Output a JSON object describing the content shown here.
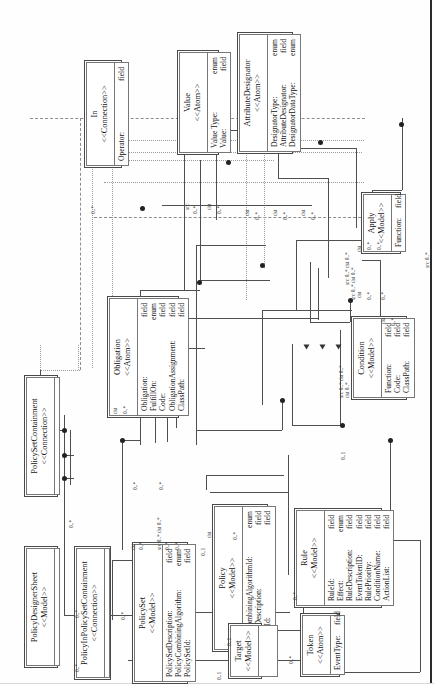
{
  "diagram": {
    "orientation": "rotated-90-ccw",
    "line_color": "#4f4f4f",
    "box_border_color": "#4a4a4a",
    "background": "#ffffff"
  },
  "classes": [
    {
      "id": "policy-designer-sheet",
      "name": "PolicyDesignerSheet",
      "stereotype": "<<Model>>",
      "attributes": []
    },
    {
      "id": "policy-set-containment",
      "name": "PolicySetContainment",
      "stereotype": "<<Connection>>",
      "attributes": []
    },
    {
      "id": "policy-in-policy-set-containment",
      "name": "PolicyInPolicySetContainment",
      "stereotype": "<<Connection>>",
      "attributes": []
    },
    {
      "id": "policy-set",
      "name": "PolicySet",
      "stereotype": "<<Model>>",
      "attributes": [
        {
          "aname": "PolicySetDescription:",
          "atype": "field"
        },
        {
          "aname": "PolicyCombiningAlgorithm:",
          "atype": "enum"
        },
        {
          "aname": "PolicySetId:",
          "atype": "field"
        }
      ]
    },
    {
      "id": "policy",
      "name": "Policy",
      "stereotype": "<<Model>>",
      "attributes": [
        {
          "aname": "RuleCombiningAlgorithmId:",
          "atype": "enum"
        },
        {
          "aname": "PolicyDescription:",
          "atype": "field"
        },
        {
          "aname": "PolicyId:",
          "atype": "field"
        }
      ]
    },
    {
      "id": "target",
      "name": "Target",
      "stereotype": "<<Model>>",
      "attributes": []
    },
    {
      "id": "token",
      "name": "Token",
      "stereotype": "<<Atom>>",
      "attributes": [
        {
          "aname": "EventType:",
          "atype": "field"
        }
      ]
    },
    {
      "id": "rule",
      "name": "Rule",
      "stereotype": "<<Model>>",
      "attributes": [
        {
          "aname": "RuleId:",
          "atype": "field"
        },
        {
          "aname": "Effect:",
          "atype": "enum"
        },
        {
          "aname": "RuleDescription:",
          "atype": "field"
        },
        {
          "aname": "EventTokenID:",
          "atype": "field"
        },
        {
          "aname": "RulePriority:",
          "atype": "field"
        },
        {
          "aname": "ConditionName:",
          "atype": "field"
        },
        {
          "aname": "ActionList:",
          "atype": "field"
        }
      ]
    },
    {
      "id": "condition",
      "name": "Condition",
      "stereotype": "<<Model>>",
      "attributes": [
        {
          "aname": "Function:",
          "atype": "field"
        },
        {
          "aname": "Code:",
          "atype": "field"
        },
        {
          "aname": "ClassPath:",
          "atype": "field"
        }
      ]
    },
    {
      "id": "obligation",
      "name": "Obligation",
      "stereotype": "<<Atom>>",
      "attributes": [
        {
          "aname": "Obligation:",
          "atype": "field"
        },
        {
          "aname": "FulfillOn:",
          "atype": "enum"
        },
        {
          "aname": "Code:",
          "atype": "field"
        },
        {
          "aname": "ObligationAssignment:",
          "atype": "field"
        },
        {
          "aname": "ClassPath:",
          "atype": "field"
        }
      ]
    },
    {
      "id": "apply",
      "name": "Apply",
      "stereotype": "<<Model>>",
      "attributes": [
        {
          "aname": "Function:",
          "atype": "field"
        }
      ]
    },
    {
      "id": "in",
      "name": "In",
      "stereotype": "<<Connection>>",
      "attributes": [
        {
          "aname": "Operator:",
          "atype": "field"
        }
      ]
    },
    {
      "id": "value",
      "name": "Value",
      "stereotype": "<<Atom>>",
      "attributes": [
        {
          "aname": "Value Type:",
          "atype": "enum"
        },
        {
          "aname": "Value:",
          "atype": "field"
        }
      ]
    },
    {
      "id": "attribute-designator",
      "name": "AttributeDesignator",
      "stereotype": "<<Atom>>",
      "attributes": [
        {
          "aname": "DesignatorType:",
          "atype": "enum"
        },
        {
          "aname": "AttributeDesignator:",
          "atype": "field"
        },
        {
          "aname": "DesignatorDataType:",
          "atype": "enum"
        }
      ]
    }
  ],
  "multiplicities": [
    {
      "id": "m1",
      "label": "0..*"
    },
    {
      "id": "m2",
      "label": "0..*"
    },
    {
      "id": "m3",
      "label": "0..*"
    },
    {
      "id": "m4",
      "label": "0..1"
    },
    {
      "id": "m5",
      "label": "0..1"
    },
    {
      "id": "m6",
      "label": "0..*"
    },
    {
      "id": "m7",
      "label": "src"
    },
    {
      "id": "m8",
      "label": "dst"
    },
    {
      "id": "m9",
      "label": "src 0..* dst 0..*"
    },
    {
      "id": "m10",
      "label": "0..*"
    },
    {
      "id": "m11",
      "label": "src 0..*"
    },
    {
      "id": "m12",
      "label": "dst 0..*"
    },
    {
      "id": "m13",
      "label": "0..1"
    },
    {
      "id": "m14",
      "label": "0..*"
    }
  ]
}
